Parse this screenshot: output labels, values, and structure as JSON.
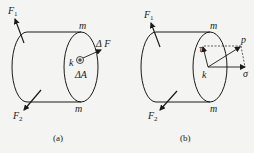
{
  "figure_a": {
    "caption": "(a)",
    "labels": {
      "F1": "F",
      "F1_sub": "1",
      "F2": "F",
      "F2_sub": "2",
      "m_top": "m",
      "m_bottom": "m",
      "point": "k",
      "force": "Δ F",
      "area": "ΔA"
    }
  },
  "figure_b": {
    "caption": "(b)",
    "labels": {
      "F1": "F",
      "F1_sub": "1",
      "F2": "F",
      "F2_sub": "2",
      "m_top": "m",
      "m_bottom": "m",
      "point": "k",
      "total_stress": "p",
      "shear_stress": "τ",
      "normal_stress": "σ"
    }
  },
  "colors": {
    "line": "#1a1a1a",
    "background": "#f4f4f2"
  }
}
